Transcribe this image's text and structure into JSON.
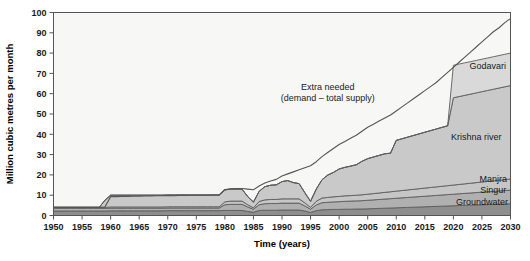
{
  "chart_data": {
    "type": "area",
    "title": "",
    "xlabel": "Time (years)",
    "ylabel": "Million cubic metres per month",
    "xlim": [
      1950,
      2030
    ],
    "ylim": [
      0,
      100
    ],
    "xticks": [
      1950,
      1955,
      1960,
      1965,
      1970,
      1975,
      1980,
      1985,
      1990,
      1995,
      2000,
      2005,
      2010,
      2015,
      2020,
      2025,
      2030
    ],
    "yticks": [
      0,
      10,
      20,
      30,
      40,
      50,
      60,
      70,
      80,
      90,
      100
    ],
    "grid": false,
    "stacked": true,
    "legend_position": "inline-right",
    "annotations": [
      {
        "text_line1": "Extra needed",
        "text_line2": "(demand – total supply)",
        "x": 1998,
        "y": 62
      }
    ],
    "x": [
      1950,
      1951,
      1952,
      1953,
      1954,
      1955,
      1956,
      1957,
      1958,
      1959,
      1960,
      1961,
      1962,
      1963,
      1964,
      1965,
      1966,
      1967,
      1968,
      1969,
      1970,
      1971,
      1972,
      1973,
      1974,
      1975,
      1976,
      1977,
      1978,
      1979,
      1980,
      1981,
      1982,
      1983,
      1984,
      1985,
      1986,
      1987,
      1988,
      1989,
      1990,
      1991,
      1992,
      1993,
      1994,
      1995,
      1996,
      1997,
      1998,
      1999,
      2000,
      2001,
      2002,
      2003,
      2004,
      2005,
      2006,
      2007,
      2008,
      2009,
      2010,
      2011,
      2012,
      2013,
      2014,
      2015,
      2016,
      2017,
      2018,
      2019,
      2020,
      2021,
      2022,
      2023,
      2024,
      2025,
      2026,
      2027,
      2028,
      2029,
      2030
    ],
    "series": [
      {
        "name": "Groundwater",
        "color": "#8e8e8e",
        "values": [
          2.2,
          2.2,
          2.2,
          2.2,
          2.2,
          2.2,
          2.2,
          2.2,
          2.2,
          2.2,
          2.3,
          2.3,
          2.3,
          2.3,
          2.3,
          2.3,
          2.3,
          2.3,
          2.3,
          2.3,
          2.4,
          2.4,
          2.4,
          2.4,
          2.4,
          2.4,
          2.4,
          2.4,
          2.4,
          2.4,
          2.5,
          2.5,
          2.5,
          2.5,
          2.0,
          1.6,
          2.5,
          2.6,
          2.6,
          2.6,
          2.7,
          2.7,
          2.7,
          2.7,
          2.2,
          1.5,
          2.4,
          2.8,
          2.9,
          3.0,
          3.0,
          3.1,
          3.1,
          3.2,
          3.2,
          3.3,
          3.4,
          3.5,
          3.6,
          3.7,
          3.8,
          3.9,
          4.0,
          4.1,
          4.2,
          4.3,
          4.4,
          4.5,
          4.6,
          4.7,
          4.8,
          4.9,
          5.0,
          5.1,
          5.2,
          5.3,
          5.4,
          5.5,
          5.6,
          5.7,
          5.8
        ]
      },
      {
        "name": "Singur",
        "color": "#b0b0b0",
        "values": [
          1.3,
          1.3,
          1.3,
          1.3,
          1.3,
          1.3,
          1.3,
          1.3,
          1.3,
          1.3,
          1.3,
          1.3,
          1.3,
          1.3,
          1.3,
          1.3,
          1.3,
          1.3,
          1.3,
          1.3,
          1.3,
          1.3,
          1.3,
          1.3,
          1.3,
          1.3,
          1.3,
          1.3,
          1.3,
          1.3,
          2.8,
          3.0,
          3.0,
          3.0,
          2.2,
          1.5,
          2.8,
          3.2,
          3.3,
          3.3,
          3.4,
          3.4,
          3.4,
          3.4,
          2.5,
          1.6,
          2.8,
          3.5,
          3.6,
          3.7,
          3.8,
          3.9,
          4.0,
          4.0,
          4.1,
          4.2,
          4.3,
          4.4,
          4.5,
          4.6,
          4.7,
          4.8,
          4.9,
          5.0,
          5.1,
          5.2,
          5.3,
          5.4,
          5.5,
          5.6,
          5.7,
          5.8,
          5.9,
          6.0,
          6.1,
          6.2,
          6.3,
          6.4,
          6.5,
          6.6,
          6.7
        ]
      },
      {
        "name": "Manjra",
        "color": "#c6c6c6",
        "values": [
          0.5,
          0.5,
          0.5,
          0.5,
          0.5,
          0.5,
          0.5,
          0.5,
          0.5,
          0.5,
          0.6,
          0.6,
          0.6,
          0.6,
          0.6,
          0.6,
          0.6,
          0.6,
          0.6,
          0.6,
          0.6,
          0.6,
          0.6,
          0.6,
          0.6,
          0.6,
          0.6,
          0.6,
          0.6,
          0.6,
          1.4,
          1.6,
          1.6,
          1.6,
          1.1,
          0.7,
          1.6,
          1.9,
          2.0,
          2.0,
          2.1,
          2.1,
          2.1,
          2.1,
          1.5,
          0.9,
          1.8,
          2.3,
          2.4,
          2.5,
          2.6,
          2.7,
          2.7,
          2.8,
          2.9,
          3.0,
          3.1,
          3.2,
          3.3,
          3.4,
          3.5,
          3.6,
          3.7,
          3.8,
          3.9,
          4.0,
          4.1,
          4.2,
          4.3,
          4.4,
          4.5,
          4.6,
          4.7,
          4.8,
          4.9,
          5.0,
          5.1,
          5.2,
          5.3,
          5.4,
          5.5
        ]
      },
      {
        "name": "Krishna river",
        "color": "#c9c9c9",
        "values": [
          0,
          0,
          0,
          0,
          0,
          0,
          0,
          0,
          0,
          3.5,
          5.8,
          5.8,
          5.8,
          5.8,
          5.8,
          5.8,
          5.8,
          5.8,
          5.8,
          5.8,
          5.8,
          5.8,
          5.8,
          5.8,
          5.8,
          5.8,
          5.8,
          5.8,
          5.8,
          5.8,
          5.9,
          5.9,
          5.9,
          5.9,
          4.0,
          2.8,
          5.0,
          6.5,
          7.0,
          7.2,
          8.5,
          9.0,
          8.0,
          7.5,
          5.0,
          3.0,
          6.0,
          9.0,
          11.0,
          12.0,
          13.5,
          14.0,
          14.5,
          15.0,
          16.5,
          17.5,
          18.0,
          18.5,
          19.0,
          19.0,
          25.0,
          25.5,
          26.0,
          26.5,
          27.0,
          27.5,
          28.0,
          28.5,
          29.0,
          29.5,
          43.0,
          43.3,
          43.6,
          43.9,
          44.2,
          44.5,
          44.8,
          45.1,
          45.4,
          45.7,
          46.0
        ]
      },
      {
        "name": "Godavari",
        "color": "#d9d9d9",
        "values": [
          0,
          0,
          0,
          0,
          0,
          0,
          0,
          0,
          0,
          0,
          0,
          0,
          0,
          0,
          0,
          0,
          0,
          0,
          0,
          0,
          0,
          0,
          0,
          0,
          0,
          0,
          0,
          0,
          0,
          0,
          0,
          0,
          0,
          0,
          0,
          0,
          0,
          0,
          0,
          0,
          0,
          0,
          0,
          0,
          0,
          0,
          0,
          0,
          0,
          0,
          0,
          0,
          0,
          0,
          0,
          0,
          0,
          0,
          0,
          0,
          0,
          0,
          0,
          0,
          0,
          0,
          0,
          0,
          0,
          0,
          16.0,
          16.0,
          16.0,
          16.0,
          16.0,
          16.0,
          16.0,
          16.0,
          16.0,
          16.0,
          16.0
        ]
      }
    ],
    "demand_line": {
      "name": "Total demand",
      "color": "#555555",
      "values": [
        4.0,
        4.0,
        4.0,
        4.0,
        4.0,
        4.0,
        4.0,
        4.0,
        4.1,
        4.2,
        9.3,
        9.3,
        9.4,
        9.4,
        9.5,
        9.5,
        9.6,
        9.6,
        9.7,
        9.7,
        9.8,
        9.8,
        9.9,
        9.9,
        10.0,
        10.0,
        10.0,
        10.0,
        10.1,
        10.1,
        12.8,
        13.2,
        13.3,
        13.3,
        13.0,
        12.7,
        14.5,
        16.0,
        17.0,
        17.8,
        19.5,
        20.5,
        21.5,
        22.5,
        23.5,
        24.5,
        26.5,
        29.0,
        31.0,
        33.0,
        35.0,
        36.5,
        38.0,
        39.5,
        41.5,
        43.5,
        45.0,
        46.5,
        48.0,
        49.5,
        51.5,
        53.5,
        55.5,
        57.5,
        59.5,
        61.5,
        63.5,
        65.5,
        68.0,
        70.5,
        73.0,
        75.5,
        78.0,
        80.5,
        83.0,
        85.5,
        88.0,
        90.5,
        92.5,
        95.0,
        97.0
      ]
    },
    "series_label_positions": [
      {
        "name": "Godavari",
        "x": 2026,
        "y": 72
      },
      {
        "name": "Krishna river",
        "x": 2024,
        "y": 37
      },
      {
        "name": "Manjra",
        "x": 2027,
        "y": 16.5
      },
      {
        "name": "Singur",
        "x": 2027,
        "y": 11.0
      },
      {
        "name": "Groundwater",
        "x": 2025,
        "y": 5.0
      }
    ]
  },
  "axes": {
    "y_title": "Million cubic metres per month",
    "x_title": "Time (years)"
  },
  "colors": {
    "axis": "#555555",
    "plot_bg": "#f7f7f5",
    "page_bg": "#ffffff",
    "text": "#1a1a1a"
  }
}
